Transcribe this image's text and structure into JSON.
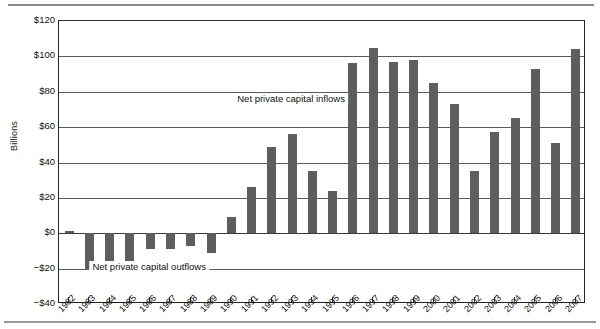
{
  "figure": {
    "y_axis_title": "Billions",
    "annotation_inflows": "Net private capital inflows",
    "annotation_outflows": "Net private capital outflows"
  },
  "chart_data": {
    "type": "bar",
    "title": "",
    "subtitle": "",
    "xlabel": "",
    "ylabel": "Billions",
    "ylim": [
      -40,
      120
    ],
    "ytick_values": [
      120,
      100,
      80,
      60,
      40,
      20,
      0,
      -20,
      -40
    ],
    "ytick_labels": [
      "$120",
      "$100",
      "$80",
      "$60",
      "$40",
      "$20",
      "$0",
      "−$20",
      "−$40"
    ],
    "grid": true,
    "legend": "none",
    "bar_color": "#5e5e5e",
    "categories": [
      "1982",
      "1983",
      "1984",
      "1985",
      "1986",
      "1987",
      "1988",
      "1989",
      "1990",
      "1991",
      "1992",
      "1993",
      "1994",
      "1995",
      "1996",
      "1997",
      "1998",
      "1999",
      "2000",
      "2001",
      "2002",
      "2003",
      "2004",
      "2005",
      "2006",
      "2007"
    ],
    "values": [
      1,
      -21,
      -16,
      -16,
      -9,
      -9,
      -7,
      -11,
      9,
      26,
      49,
      56,
      35,
      24,
      96,
      105,
      97,
      98,
      85,
      73,
      35,
      57,
      65,
      93,
      51,
      104
    ],
    "annotations": [
      {
        "text": "Net private capital inflows",
        "x_category": "1993",
        "y_value": 75
      },
      {
        "text": "Net private capital outflows",
        "x_category": "1986",
        "y_value": -20
      }
    ]
  }
}
